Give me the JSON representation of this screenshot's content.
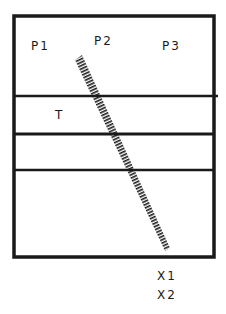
{
  "diagram": {
    "type": "schematic cross-section with diagonal hatched element",
    "colors": {
      "background": "#ffffff",
      "stroke": "#1a1a1a"
    },
    "outer_box": {
      "x": 14,
      "y": 16,
      "width": 200,
      "height": 241
    },
    "layer_lines": [
      {
        "y": 96,
        "x2": 218
      },
      {
        "y": 134,
        "x2": 214
      },
      {
        "y": 170,
        "x2": 214
      }
    ],
    "hatched_element": {
      "x1": 79,
      "y1": 58,
      "x2": 167,
      "y2": 249
    },
    "labels": {
      "p1": "P1",
      "p2": "P2",
      "p3": "P3",
      "t": "T",
      "x1": "X1",
      "x2": "X2"
    }
  }
}
